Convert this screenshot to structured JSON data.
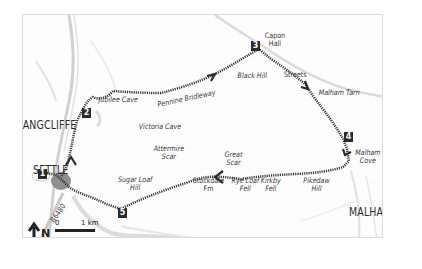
{
  "map": {
    "towns": [
      {
        "id": "langcliffe",
        "label": "LANGCLIFFE"
      },
      {
        "id": "settle",
        "label": "SETTLE"
      },
      {
        "id": "malham",
        "label": "MALHAM"
      }
    ],
    "features": [
      {
        "id": "jubilee-cave",
        "label": "Jubilee Cave"
      },
      {
        "id": "victoria-cave",
        "label": "Victoria Cave"
      },
      {
        "id": "pennine-bridleway",
        "label": "Pennine Bridleway"
      },
      {
        "id": "black-hill",
        "label": "Black Hill"
      },
      {
        "id": "capon-hall",
        "line1": "Capon",
        "line2": "Hall"
      },
      {
        "id": "streets",
        "label": "Streets"
      },
      {
        "id": "malham-tarn",
        "label": "Malham Tarn"
      },
      {
        "id": "malham-cove",
        "line1": "Malham",
        "line2": "Cove"
      },
      {
        "id": "attermire-scar",
        "line1": "Attermire",
        "line2": "Scar"
      },
      {
        "id": "sugar-loaf-hill",
        "line1": "Sugar Loaf",
        "line2": "Hill"
      },
      {
        "id": "stockdale-fm",
        "line1": "Stockdale",
        "line2": "Fm"
      },
      {
        "id": "great-scar",
        "line1": "Great",
        "line2": "Scar"
      },
      {
        "id": "rye-loaf-fell",
        "line1": "Rye Loaf",
        "line2": "Fell"
      },
      {
        "id": "kirkby-fell",
        "line1": "Kirkby",
        "line2": "Fell"
      },
      {
        "id": "pikedaw-hill",
        "line1": "Pikedaw",
        "line2": "Hill"
      }
    ],
    "road": {
      "label": "B6480"
    },
    "waypoints": [
      "1",
      "2",
      "3",
      "4",
      "5"
    ],
    "north": {
      "label": "N"
    },
    "scale": {
      "start": "0",
      "end": "1 km"
    },
    "colors": {
      "route": "#3a3a3a",
      "roads": "#c8c8c8",
      "town": "#9a9a9a",
      "waypoint_bg": "#2a2a2a",
      "frame": "#dcdcdc"
    }
  }
}
